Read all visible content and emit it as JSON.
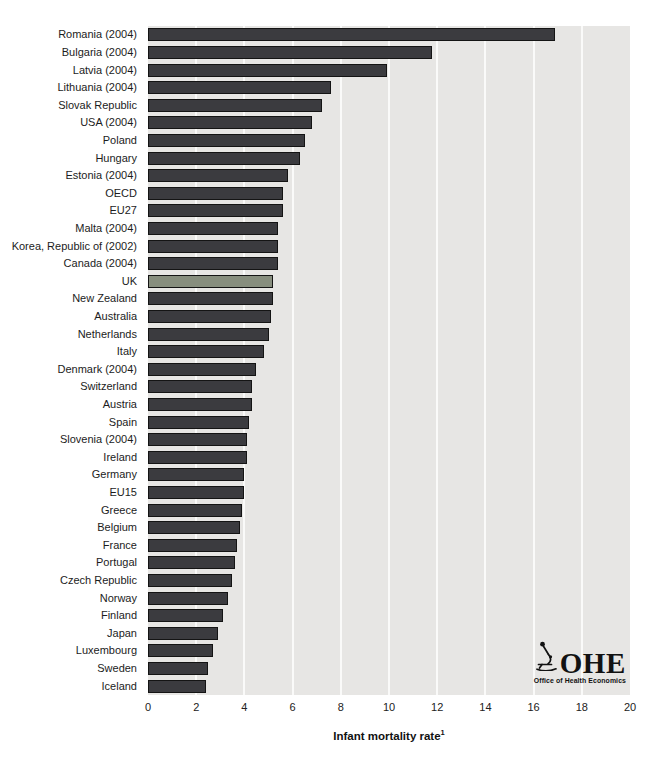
{
  "chart_data": {
    "type": "bar",
    "orientation": "horizontal",
    "title": "",
    "xlabel": "Infant mortality rate¹",
    "ylabel": "",
    "xlim": [
      0,
      20
    ],
    "xticks": [
      0,
      2,
      4,
      6,
      8,
      10,
      12,
      14,
      16,
      18,
      20
    ],
    "grid": "vertical-white-on-gray",
    "legend": "none",
    "highlight_category": "UK",
    "categories": [
      "Romania (2004)",
      "Bulgaria (2004)",
      "Latvia (2004)",
      "Lithuania (2004)",
      "Slovak Republic",
      "USA (2004)",
      "Poland",
      "Hungary",
      "Estonia (2004)",
      "OECD",
      "EU27",
      "Malta (2004)",
      "Korea, Republic of (2002)",
      "Canada (2004)",
      "UK",
      "New Zealand",
      "Australia",
      "Netherlands",
      "Italy",
      "Denmark (2004)",
      "Switzerland",
      "Austria",
      "Spain",
      "Slovenia (2004)",
      "Ireland",
      "Germany",
      "EU15",
      "Greece",
      "Belgium",
      "France",
      "Portugal",
      "Czech Republic",
      "Norway",
      "Finland",
      "Japan",
      "Luxembourg",
      "Sweden",
      "Iceland"
    ],
    "values": [
      16.9,
      11.8,
      9.9,
      7.6,
      7.2,
      6.8,
      6.5,
      6.3,
      5.8,
      5.6,
      5.6,
      5.4,
      5.4,
      5.4,
      5.2,
      5.2,
      5.1,
      5.0,
      4.8,
      4.5,
      4.3,
      4.3,
      4.2,
      4.1,
      4.1,
      4.0,
      4.0,
      3.9,
      3.8,
      3.7,
      3.6,
      3.5,
      3.3,
      3.1,
      2.9,
      2.7,
      2.5,
      2.4
    ]
  },
  "axis": {
    "xlabel_text": "Infant mortality rate",
    "xlabel_superscript": "1"
  },
  "colors": {
    "page_background": "#ffffff",
    "plot_background": "#e7e6e4",
    "gridline": "#fafaf9",
    "bar_fill": "#3b3b3f",
    "bar_border": "#141414",
    "highlight_fill": "#878e7e",
    "text": "#1c1c1c"
  },
  "logo": {
    "name": "OHE",
    "subtitle": "Office of Health Economics",
    "icon": "microscope-icon"
  }
}
